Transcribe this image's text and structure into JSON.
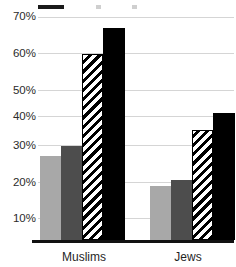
{
  "chart_data": {
    "type": "bar",
    "title": "",
    "subtitle": "",
    "xlabel": "",
    "ylabel": "",
    "categories": [
      "Muslims",
      "Jews"
    ],
    "series": [
      {
        "name": "Series 1",
        "style": "light-gray-solid",
        "color": "#a8a8a8",
        "values": [
          27,
          17.5
        ]
      },
      {
        "name": "Series 2",
        "style": "dark-gray-solid",
        "color": "#4d4d4d",
        "values": [
          30.5,
          19.5
        ]
      },
      {
        "name": "Series 3",
        "style": "diagonal-hatch",
        "color": "#000000",
        "values": [
          60,
          35.5
        ]
      },
      {
        "name": "Series 4",
        "style": "black-solid",
        "color": "#000000",
        "values": [
          68.5,
          41
        ]
      }
    ],
    "ylim": [
      0,
      73
    ],
    "ytick_values": [
      10,
      20,
      30,
      40,
      50,
      60,
      70
    ],
    "ytick_labels": [
      "10%",
      "20%",
      "30%",
      "40%",
      "50%",
      "60%",
      "70%"
    ],
    "grid": true,
    "grid_color": "#d5d5d5",
    "legend_position": "top",
    "legend_cropped": true,
    "value_format": "percent"
  },
  "legend": {
    "entries": [
      {
        "label": "",
        "swatch": "black-solid"
      },
      {
        "label": "",
        "swatch": "partial"
      },
      {
        "label": "",
        "swatch": "partial"
      }
    ]
  },
  "axis": {
    "x_labels": [
      "Muslims",
      "Jews"
    ],
    "y_labels": [
      "70%",
      "60%",
      "50%",
      "40%",
      "30%",
      "20%",
      "10%"
    ]
  }
}
